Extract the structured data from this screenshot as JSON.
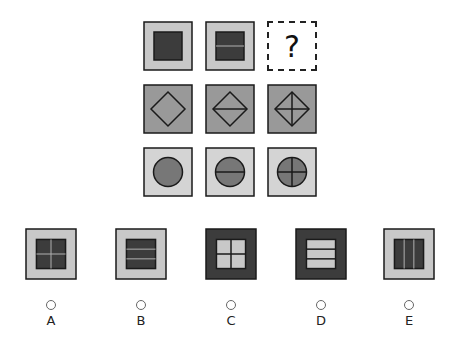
{
  "puzzle": {
    "missing_symbol": "?",
    "rows": [
      {
        "shape": "square",
        "outer_fill": "#c8c8c8",
        "inner_fill": "#3c3c3c",
        "cells": [
          "plain",
          "one-horizontal-line",
          "missing"
        ]
      },
      {
        "shape": "diamond",
        "outer_fill": "#999999",
        "inner_fill": "#999999",
        "cells": [
          "plain",
          "one-horizontal-line",
          "cross"
        ]
      },
      {
        "shape": "circle",
        "outer_fill": "#d4d4d4",
        "inner_fill": "#777777",
        "cells": [
          "plain",
          "one-horizontal-line",
          "cross"
        ]
      }
    ]
  },
  "options": [
    {
      "label": "A",
      "outer_fill": "#c8c8c8",
      "inner_fill": "#3c3c3c",
      "divider": "cross"
    },
    {
      "label": "B",
      "outer_fill": "#c8c8c8",
      "inner_fill": "#3c3c3c",
      "divider": "two-horizontal-lines"
    },
    {
      "label": "C",
      "outer_fill": "#3c3c3c",
      "inner_fill": "#c8c8c8",
      "divider": "cross"
    },
    {
      "label": "D",
      "outer_fill": "#3c3c3c",
      "inner_fill": "#c8c8c8",
      "divider": "two-horizontal-lines"
    },
    {
      "label": "E",
      "outer_fill": "#c8c8c8",
      "inner_fill": "#3c3c3c",
      "divider": "two-vertical-lines"
    }
  ]
}
